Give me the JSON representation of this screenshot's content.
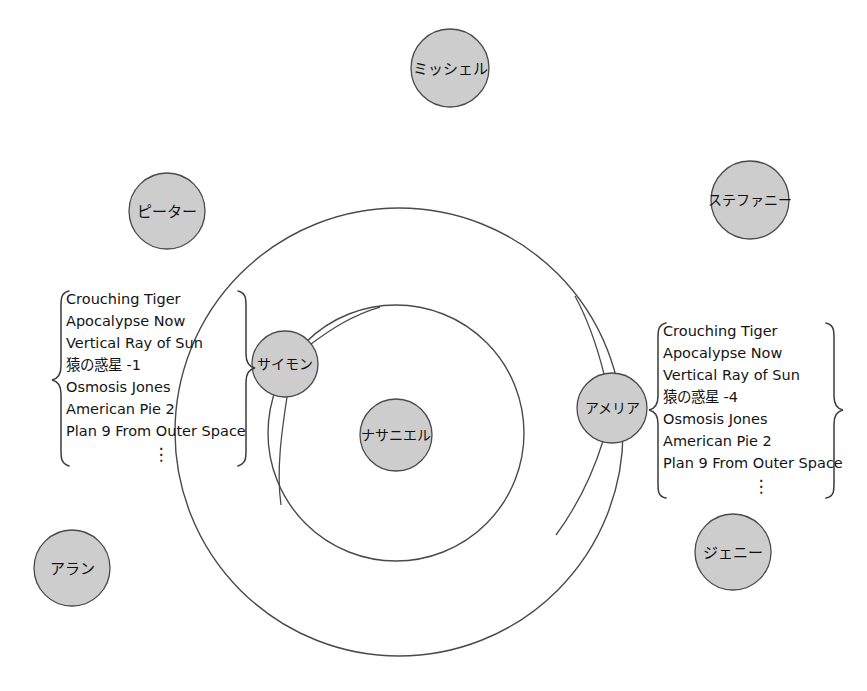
{
  "diagram": {
    "type": "concentric-social-network",
    "background_color": "#ffffff",
    "node_fill_color": "#cdcdcd",
    "node_stroke_color": "#4a4a4a",
    "ring_stroke_color": "#4a4a4a",
    "nodes": [
      {
        "id": "nathaniel",
        "label": "ナサニエル",
        "ring": "center",
        "cx": 396,
        "cy": 435,
        "r": 36
      },
      {
        "id": "simon",
        "label": "サイモン",
        "ring": "inner",
        "cx": 285,
        "cy": 364,
        "r": 33
      },
      {
        "id": "amelia",
        "label": "アメリア",
        "ring": "outer",
        "cx": 612,
        "cy": 408,
        "r": 35
      },
      {
        "id": "michelle",
        "label": "ミッシェル",
        "ring": "outside",
        "cx": 450,
        "cy": 68,
        "r": 39
      },
      {
        "id": "peter",
        "label": "ピーター",
        "ring": "outside",
        "cx": 167,
        "cy": 211,
        "r": 38
      },
      {
        "id": "stephanie",
        "label": "ステファニー",
        "ring": "outside",
        "cx": 750,
        "cy": 200,
        "r": 39
      },
      {
        "id": "alan",
        "label": "アラン",
        "ring": "outside",
        "cx": 72,
        "cy": 568,
        "r": 38
      },
      {
        "id": "jenny",
        "label": "ジェニー",
        "ring": "outside",
        "cx": 733,
        "cy": 552,
        "r": 38
      }
    ],
    "rings": [
      {
        "id": "inner-ring",
        "cx": 396,
        "cy": 433,
        "r": 128
      },
      {
        "id": "outer-ring",
        "cx": 399,
        "cy": 432,
        "r": 224
      }
    ],
    "lists": [
      {
        "id": "simon-list",
        "attached_to": "simon",
        "side": "left",
        "items": [
          "Crouching Tiger",
          "Apocalypse Now",
          "Vertical Ray of Sun",
          "猿の惑星 -1",
          "Osmosis Jones",
          "American Pie 2",
          "Plan 9 From Outer Space"
        ],
        "continuation": "⋮"
      },
      {
        "id": "amelia-list",
        "attached_to": "amelia",
        "side": "right",
        "items": [
          "Crouching Tiger",
          "Apocalypse Now",
          "Vertical Ray of Sun",
          "猿の惑星 -4",
          "Osmosis Jones",
          "American Pie 2",
          "Plan 9 From Outer Space"
        ],
        "continuation": "⋮"
      }
    ]
  }
}
